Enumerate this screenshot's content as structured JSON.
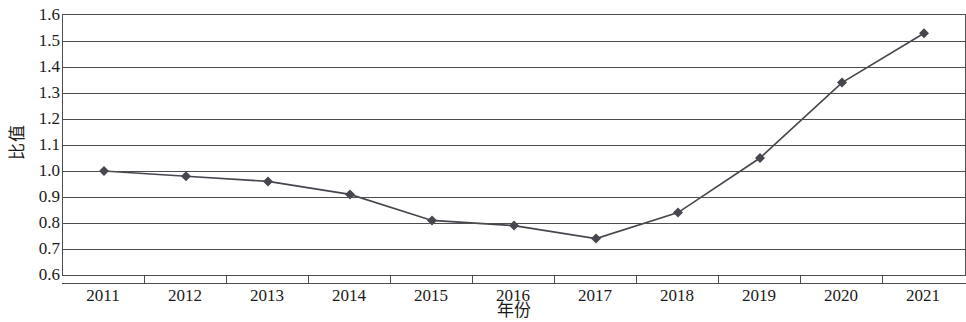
{
  "chart_data": {
    "type": "line",
    "title": "",
    "xlabel": "年份",
    "ylabel": "比值",
    "categories": [
      "2011",
      "2012",
      "2013",
      "2014",
      "2015",
      "2016",
      "2017",
      "2018",
      "2019",
      "2020",
      "2021"
    ],
    "values": [
      1.0,
      0.98,
      0.96,
      0.91,
      0.81,
      0.79,
      0.74,
      0.84,
      1.05,
      1.34,
      1.53
    ],
    "series": [
      {
        "name": "比值",
        "values": [
          1.0,
          0.98,
          0.96,
          0.91,
          0.81,
          0.79,
          0.74,
          0.84,
          1.05,
          1.34,
          1.53
        ]
      }
    ],
    "ylim": [
      0.6,
      1.6
    ],
    "y_ticks": [
      "1.6",
      "1.5",
      "1.4",
      "1.3",
      "1.2",
      "1.1",
      "1.0",
      "0.9",
      "0.8",
      "0.7",
      "0.6"
    ],
    "y_tick_values": [
      1.6,
      1.5,
      1.4,
      1.3,
      1.2,
      1.1,
      1.0,
      0.9,
      0.8,
      0.7,
      0.6
    ],
    "y_tick_step": 0.1,
    "grid": "horizontal",
    "legend": "none",
    "marker": "diamond",
    "line_color": "#46464e",
    "marker_color": "#46464e",
    "axis_color": "#4d4d4d",
    "grid_color": "#4d4d4d",
    "background": "#ffffff"
  }
}
